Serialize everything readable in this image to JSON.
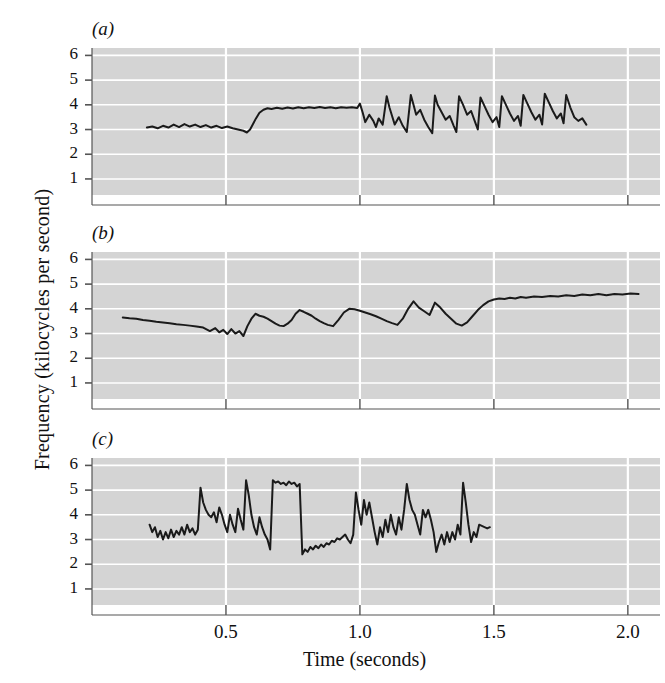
{
  "figure": {
    "axis_label_y": "Frequency (kilocycles per second)",
    "axis_label_x": "Time (seconds)",
    "y_ticks": [
      6,
      5,
      4,
      3,
      2,
      1
    ],
    "x_ticks": [
      "0.5",
      "1.0",
      "1.5",
      "2.0"
    ],
    "x_tick_values": [
      0.5,
      1.0,
      1.5,
      2.0
    ],
    "plot_bg_color": "#d4d4d4",
    "gridline_color": "#ffffff",
    "trace_color": "#1a1a1a",
    "axis_color": "#555555"
  },
  "panels": [
    {
      "letter": "(a)",
      "title": "Wild bird"
    },
    {
      "letter": "(b)",
      "title": "Isolated hand-reared bird"
    },
    {
      "letter": "(c)",
      "title": "Deaf bird"
    }
  ],
  "chart_data": [
    {
      "type": "line",
      "title": "Wild bird",
      "panel": "(a)",
      "xlabel": "Time (seconds)",
      "ylabel": "Frequency (kilocycles per second)",
      "xlim": [
        0.0,
        2.12
      ],
      "ylim": [
        0.35,
        6.3
      ],
      "grid": true,
      "x": [
        0.205,
        0.225,
        0.245,
        0.265,
        0.285,
        0.305,
        0.325,
        0.345,
        0.365,
        0.385,
        0.405,
        0.425,
        0.445,
        0.465,
        0.485,
        0.505,
        0.525,
        0.545,
        0.565,
        0.578,
        0.59,
        0.6,
        0.612,
        0.625,
        0.64,
        0.655,
        0.67,
        0.69,
        0.71,
        0.73,
        0.75,
        0.77,
        0.79,
        0.81,
        0.83,
        0.85,
        0.87,
        0.89,
        0.91,
        0.93,
        0.95,
        0.97,
        0.99,
        1.0,
        1.01,
        1.02,
        1.035,
        1.05,
        1.06,
        1.07,
        1.085,
        1.1,
        1.11,
        1.12,
        1.13,
        1.145,
        1.16,
        1.175,
        1.19,
        1.2,
        1.21,
        1.225,
        1.24,
        1.255,
        1.27,
        1.28,
        1.29,
        1.305,
        1.32,
        1.335,
        1.35,
        1.36,
        1.37,
        1.385,
        1.4,
        1.415,
        1.43,
        1.44,
        1.45,
        1.465,
        1.48,
        1.495,
        1.51,
        1.52,
        1.53,
        1.545,
        1.56,
        1.575,
        1.59,
        1.6,
        1.61,
        1.625,
        1.64,
        1.655,
        1.67,
        1.68,
        1.69,
        1.705,
        1.72,
        1.735,
        1.75,
        1.76,
        1.77,
        1.785,
        1.8,
        1.815,
        1.83,
        1.845
      ],
      "y": [
        3.08,
        3.12,
        3.05,
        3.15,
        3.08,
        3.2,
        3.1,
        3.22,
        3.12,
        3.2,
        3.1,
        3.18,
        3.08,
        3.15,
        3.06,
        3.12,
        3.05,
        3.0,
        2.95,
        2.88,
        3.0,
        3.2,
        3.45,
        3.68,
        3.8,
        3.86,
        3.83,
        3.88,
        3.84,
        3.89,
        3.85,
        3.9,
        3.86,
        3.9,
        3.87,
        3.91,
        3.87,
        3.9,
        3.86,
        3.9,
        3.88,
        3.9,
        3.87,
        4.05,
        3.7,
        3.3,
        3.6,
        3.35,
        3.1,
        3.45,
        3.2,
        4.35,
        3.9,
        3.55,
        3.2,
        3.5,
        3.15,
        2.9,
        4.4,
        4.0,
        3.6,
        3.8,
        3.4,
        3.1,
        2.85,
        4.38,
        4.0,
        3.7,
        3.4,
        3.55,
        3.15,
        2.9,
        4.35,
        4.0,
        3.6,
        3.75,
        3.3,
        3.0,
        4.3,
        3.95,
        3.6,
        3.3,
        3.5,
        3.1,
        4.35,
        4.0,
        3.65,
        3.35,
        3.55,
        3.15,
        4.4,
        4.05,
        3.7,
        3.4,
        3.6,
        3.2,
        4.45,
        4.1,
        3.75,
        3.45,
        3.65,
        3.25,
        4.4,
        3.9,
        3.5,
        3.35,
        3.45,
        3.2,
        3.05
      ]
    },
    {
      "type": "line",
      "title": "Isolated hand-reared bird",
      "panel": "(b)",
      "xlabel": "Time (seconds)",
      "ylabel": "Frequency (kilocycles per second)",
      "xlim": [
        0.0,
        2.12
      ],
      "ylim": [
        0.35,
        6.3
      ],
      "grid": true,
      "x": [
        0.115,
        0.14,
        0.165,
        0.19,
        0.215,
        0.24,
        0.265,
        0.29,
        0.315,
        0.34,
        0.365,
        0.39,
        0.415,
        0.44,
        0.46,
        0.475,
        0.49,
        0.505,
        0.52,
        0.535,
        0.55,
        0.565,
        0.58,
        0.595,
        0.61,
        0.625,
        0.64,
        0.655,
        0.67,
        0.685,
        0.7,
        0.715,
        0.73,
        0.745,
        0.76,
        0.775,
        0.79,
        0.805,
        0.82,
        0.835,
        0.85,
        0.865,
        0.88,
        0.9,
        0.92,
        0.94,
        0.96,
        0.98,
        1.0,
        1.02,
        1.04,
        1.06,
        1.08,
        1.1,
        1.12,
        1.14,
        1.16,
        1.18,
        1.2,
        1.22,
        1.24,
        1.26,
        1.28,
        1.3,
        1.32,
        1.34,
        1.36,
        1.38,
        1.4,
        1.42,
        1.44,
        1.46,
        1.48,
        1.5,
        1.52,
        1.54,
        1.56,
        1.58,
        1.6,
        1.62,
        1.65,
        1.68,
        1.71,
        1.74,
        1.77,
        1.8,
        1.83,
        1.86,
        1.89,
        1.92,
        1.95,
        1.98,
        2.01,
        2.04
      ],
      "y": [
        3.65,
        3.62,
        3.6,
        3.55,
        3.52,
        3.48,
        3.45,
        3.42,
        3.38,
        3.35,
        3.32,
        3.28,
        3.24,
        3.1,
        3.22,
        3.05,
        3.15,
        2.98,
        3.18,
        3.0,
        3.1,
        2.9,
        3.3,
        3.6,
        3.8,
        3.72,
        3.68,
        3.6,
        3.5,
        3.4,
        3.32,
        3.3,
        3.4,
        3.55,
        3.8,
        3.95,
        3.88,
        3.8,
        3.72,
        3.6,
        3.5,
        3.42,
        3.35,
        3.3,
        3.55,
        3.85,
        4.0,
        3.98,
        3.92,
        3.85,
        3.78,
        3.7,
        3.6,
        3.5,
        3.42,
        3.35,
        3.6,
        4.0,
        4.3,
        4.05,
        3.9,
        3.75,
        4.25,
        4.05,
        3.8,
        3.6,
        3.4,
        3.32,
        3.45,
        3.7,
        3.95,
        4.15,
        4.3,
        4.38,
        4.42,
        4.4,
        4.45,
        4.42,
        4.48,
        4.45,
        4.5,
        4.48,
        4.52,
        4.5,
        4.55,
        4.52,
        4.58,
        4.55,
        4.6,
        4.55,
        4.6,
        4.58,
        4.62,
        4.6
      ]
    },
    {
      "type": "line",
      "title": "Deaf bird",
      "panel": "(c)",
      "xlabel": "Time (seconds)",
      "ylabel": "Frequency (kilocycles per second)",
      "xlim": [
        0.0,
        2.12
      ],
      "ylim": [
        0.35,
        6.3
      ],
      "grid": true,
      "x": [
        0.215,
        0.225,
        0.235,
        0.245,
        0.255,
        0.265,
        0.275,
        0.285,
        0.295,
        0.305,
        0.315,
        0.325,
        0.335,
        0.345,
        0.355,
        0.365,
        0.375,
        0.385,
        0.395,
        0.405,
        0.415,
        0.425,
        0.435,
        0.445,
        0.455,
        0.465,
        0.475,
        0.485,
        0.495,
        0.505,
        0.515,
        0.525,
        0.535,
        0.545,
        0.555,
        0.565,
        0.575,
        0.585,
        0.595,
        0.605,
        0.615,
        0.625,
        0.635,
        0.645,
        0.655,
        0.665,
        0.675,
        0.685,
        0.695,
        0.705,
        0.715,
        0.725,
        0.735,
        0.745,
        0.755,
        0.765,
        0.775,
        0.785,
        0.795,
        0.805,
        0.815,
        0.825,
        0.835,
        0.845,
        0.855,
        0.865,
        0.875,
        0.885,
        0.895,
        0.905,
        0.915,
        0.925,
        0.935,
        0.945,
        0.955,
        0.965,
        0.975,
        0.985,
        0.995,
        1.005,
        1.015,
        1.025,
        1.035,
        1.045,
        1.055,
        1.065,
        1.075,
        1.085,
        1.095,
        1.105,
        1.115,
        1.125,
        1.135,
        1.145,
        1.155,
        1.165,
        1.175,
        1.185,
        1.195,
        1.205,
        1.215,
        1.225,
        1.235,
        1.245,
        1.255,
        1.265,
        1.275,
        1.285,
        1.295,
        1.305,
        1.315,
        1.325,
        1.335,
        1.345,
        1.355,
        1.365,
        1.375,
        1.385,
        1.395,
        1.405,
        1.415,
        1.425,
        1.435,
        1.445,
        1.455,
        1.465,
        1.475,
        1.485,
        1.495
      ],
      "y": [
        3.6,
        3.3,
        3.5,
        3.1,
        3.35,
        3.0,
        3.3,
        3.05,
        3.4,
        3.1,
        3.35,
        3.2,
        3.5,
        3.2,
        3.6,
        3.3,
        3.45,
        3.2,
        3.4,
        5.1,
        4.5,
        4.2,
        4.0,
        3.9,
        4.1,
        3.7,
        4.3,
        4.0,
        3.6,
        3.3,
        4.0,
        3.6,
        3.3,
        4.25,
        3.8,
        3.4,
        5.4,
        4.8,
        4.0,
        3.5,
        3.2,
        3.9,
        3.5,
        3.2,
        3.0,
        2.6,
        5.4,
        5.3,
        5.35,
        5.25,
        5.3,
        5.2,
        5.35,
        5.25,
        5.3,
        5.15,
        5.25,
        2.4,
        2.6,
        2.5,
        2.7,
        2.6,
        2.75,
        2.65,
        2.8,
        2.7,
        2.85,
        2.8,
        2.95,
        2.9,
        3.05,
        3.0,
        3.1,
        3.2,
        3.0,
        2.85,
        3.2,
        4.9,
        4.2,
        3.6,
        4.6,
        4.0,
        4.5,
        3.9,
        3.3,
        2.8,
        3.5,
        3.1,
        3.8,
        3.3,
        4.0,
        3.5,
        3.2,
        3.9,
        3.4,
        4.2,
        5.25,
        4.6,
        4.2,
        4.0,
        3.6,
        3.2,
        4.2,
        3.9,
        4.2,
        3.8,
        3.3,
        2.5,
        2.9,
        3.2,
        2.8,
        3.3,
        2.9,
        3.3,
        3.0,
        3.6,
        3.2,
        5.3,
        4.5,
        3.6,
        2.9,
        3.3,
        3.1,
        3.6,
        3.55,
        3.5,
        3.45,
        3.5
      ]
    }
  ]
}
